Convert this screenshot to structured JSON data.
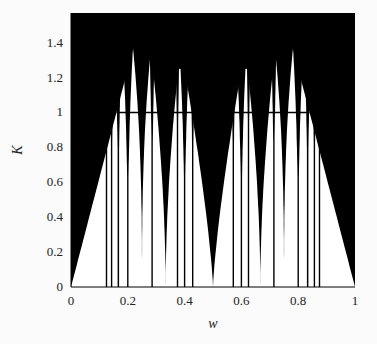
{
  "chart_data": {
    "type": "heatmap",
    "title": "",
    "xlabel": "w",
    "ylabel": "K",
    "xlim": [
      0,
      1
    ],
    "ylim": [
      0,
      1.57
    ],
    "xticks": [
      "0",
      "0.2",
      "0.4",
      "0.6",
      "0.8",
      "1"
    ],
    "yticks": [
      "0",
      "0.2",
      "0.4",
      "0.6",
      "0.8",
      "1",
      "1.2",
      "1.4"
    ],
    "grid": false,
    "legend": null,
    "annotations": [
      {
        "type": "hline",
        "y": 1.0,
        "x_range": [
          0.16,
          0.84
        ]
      }
    ],
    "tongues": [
      {
        "w": 0.0,
        "half_width_at_1": 0.16
      },
      {
        "w": 1.0,
        "half_width_at_1": 0.16
      },
      {
        "w": 0.5,
        "half_width_at_1": 0.075
      },
      {
        "w": 0.3333,
        "half_width_at_1": 0.03
      },
      {
        "w": 0.6667,
        "half_width_at_1": 0.03
      },
      {
        "w": 0.25,
        "half_width_at_1": 0.014
      },
      {
        "w": 0.75,
        "half_width_at_1": 0.014
      },
      {
        "w": 0.2,
        "half_width_at_1": 0.008
      },
      {
        "w": 0.8,
        "half_width_at_1": 0.008
      },
      {
        "w": 0.4,
        "half_width_at_1": 0.008
      },
      {
        "w": 0.6,
        "half_width_at_1": 0.008
      },
      {
        "w": 0.1667,
        "half_width_at_1": 0.005
      },
      {
        "w": 0.8333,
        "half_width_at_1": 0.005
      },
      {
        "w": 0.2857,
        "half_width_at_1": 0.004
      },
      {
        "w": 0.7143,
        "half_width_at_1": 0.004
      },
      {
        "w": 0.4286,
        "half_width_at_1": 0.004
      },
      {
        "w": 0.5714,
        "half_width_at_1": 0.004
      },
      {
        "w": 0.1429,
        "half_width_at_1": 0.004
      },
      {
        "w": 0.8571,
        "half_width_at_1": 0.004
      },
      {
        "w": 0.125,
        "half_width_at_1": 0.003
      },
      {
        "w": 0.875,
        "half_width_at_1": 0.003
      },
      {
        "w": 0.375,
        "half_width_at_1": 0.003
      },
      {
        "w": 0.625,
        "half_width_at_1": 0.003
      }
    ]
  }
}
